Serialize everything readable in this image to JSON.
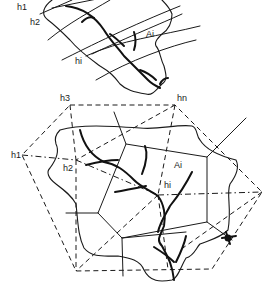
{
  "figure": {
    "top_panel": {
      "description": "Catchment with contour lines",
      "labels": {
        "h1": "h1",
        "h2": "h2",
        "hi": "hi",
        "Ai": "Ai"
      }
    },
    "bottom_panel": {
      "description": "Catchment with polygon network and dashed triangulation",
      "labels": {
        "h1": "h1",
        "h2": "h2",
        "h3": "h3",
        "hn": "hn",
        "hi": "hi",
        "Ai": "Ai"
      }
    },
    "colors": {
      "ink": "#1a1a1a",
      "background": "#ffffff"
    }
  }
}
